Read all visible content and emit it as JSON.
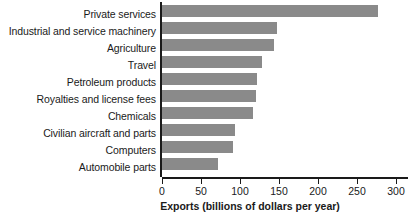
{
  "chart_data": {
    "type": "bar",
    "orientation": "horizontal",
    "title": "",
    "xlabel": "Exports (billions of dollars per year)",
    "ylabel": "",
    "xlim": [
      0,
      300
    ],
    "xticks": [
      0,
      50,
      100,
      150,
      200,
      250,
      300
    ],
    "xtick_labels": [
      "0",
      "50",
      "100",
      "150",
      "200",
      "250",
      "300"
    ],
    "grid": false,
    "legend": false,
    "bar_color": "#8a8a8a",
    "axis_color": "#1a1a1a",
    "background": "#ffffff",
    "categories": [
      "Private services",
      "Industrial and service machinery",
      "Agriculture",
      "Travel",
      "Petroleum products",
      "Royalties and license fees",
      "Chemicals",
      "Civilian aircraft and parts",
      "Computers",
      "Automobile parts"
    ],
    "values": [
      277,
      148,
      143,
      128,
      122,
      120,
      117,
      94,
      91,
      72
    ]
  }
}
